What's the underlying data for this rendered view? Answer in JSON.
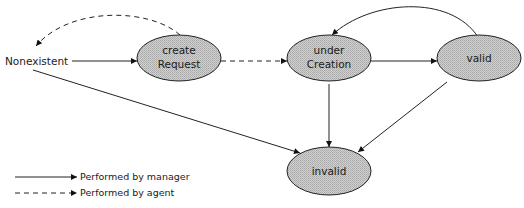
{
  "diagram": {
    "type": "state-transition",
    "colors": {
      "node_fill": "#c4c4c4",
      "node_stroke": "#222222",
      "edge": "#222222",
      "background": "#ffffff"
    },
    "start_state": {
      "id": "nonexistent",
      "label": "Nonexistent"
    },
    "nodes": [
      {
        "id": "createRequest",
        "line1": "create",
        "line2": "Request"
      },
      {
        "id": "underCreation",
        "line1": "under",
        "line2": "Creation"
      },
      {
        "id": "valid",
        "line1": "valid"
      },
      {
        "id": "invalid",
        "line1": "invalid"
      }
    ],
    "edges": [
      {
        "from": "nonexistent",
        "to": "createRequest",
        "style": "solid",
        "performed_by": "manager"
      },
      {
        "from": "createRequest",
        "to": "nonexistent",
        "style": "dashed",
        "performed_by": "agent"
      },
      {
        "from": "createRequest",
        "to": "underCreation",
        "style": "dashed",
        "performed_by": "agent"
      },
      {
        "from": "underCreation",
        "to": "valid",
        "style": "solid",
        "performed_by": "manager"
      },
      {
        "from": "valid",
        "to": "underCreation",
        "style": "solid",
        "performed_by": "manager"
      },
      {
        "from": "underCreation",
        "to": "invalid",
        "style": "solid",
        "performed_by": "manager"
      },
      {
        "from": "valid",
        "to": "invalid",
        "style": "solid",
        "performed_by": "manager"
      },
      {
        "from": "nonexistent",
        "to": "invalid",
        "style": "solid",
        "performed_by": "manager"
      }
    ],
    "legend": [
      {
        "style": "solid",
        "label": "Performed by manager"
      },
      {
        "style": "dashed",
        "label": "Performed by agent"
      }
    ]
  }
}
